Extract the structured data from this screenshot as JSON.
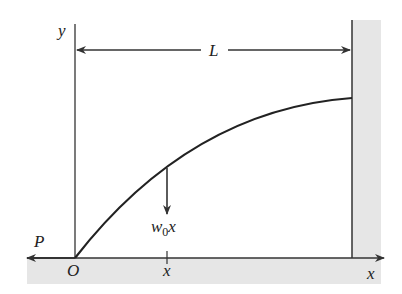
{
  "diagram": {
    "labels": {
      "y_axis": "y",
      "x_axis": "x",
      "origin": "O",
      "length": "L",
      "force": "P",
      "load_main": "w",
      "load_sub": "0",
      "load_var": "x",
      "position": "x"
    },
    "colors": {
      "line": "#333333",
      "support_fill": "#e6e6e6",
      "background": "#ffffff"
    }
  }
}
